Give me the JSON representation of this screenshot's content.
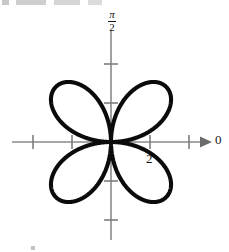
{
  "figure": {
    "caption_fragment": ""
  },
  "labels": {
    "theta_zero": "0",
    "radial_tick": "2",
    "pi_over_two_numerator": "π",
    "pi_over_two_denominator": "2"
  },
  "colors": {
    "curve": "#0b0b0b",
    "axis": "#8a8a8a",
    "tick": "#7e7e7e",
    "arrow": "#6b6b6b",
    "label_text": "#161616",
    "background": "#ffffff"
  },
  "chart_data": {
    "type": "line",
    "plot_kind": "polar-rose",
    "title": "",
    "subtitle": "",
    "xlabel": "",
    "ylabel": "",
    "equation": "r = 2 sin(2θ)",
    "petal_count": 4,
    "max_radius": 2,
    "petal_axis_angles_deg": [
      45,
      135,
      225,
      315
    ],
    "grid": false,
    "legend": null,
    "origin_px": {
      "x": 111,
      "y": 142
    },
    "pixels_per_unit": 39,
    "axes": [
      {
        "name": "polar-axis-horizontal",
        "direction": "theta = 0",
        "label": "0",
        "arrow": true,
        "start_px": {
          "x": 12,
          "y": 142
        },
        "end_px": {
          "x": 212,
          "y": 142
        },
        "tick_values": [
          -2,
          -1,
          1,
          2
        ],
        "tick_px_x": [
          33,
          72,
          150,
          189
        ],
        "labeled_ticks": [
          {
            "value": 2,
            "text": "2",
            "px_x": 150
          }
        ]
      },
      {
        "name": "polar-axis-vertical",
        "direction": "theta = pi/2",
        "label": "π/2",
        "arrow": false,
        "start_px": {
          "x": 111,
          "y": 30
        },
        "end_px": {
          "x": 111,
          "y": 240
        },
        "tick_values": [
          2,
          1,
          -1,
          -2
        ],
        "tick_px_y": [
          64,
          103,
          181,
          220
        ],
        "labeled_ticks": [
          {
            "value": 2,
            "text": "π/2",
            "px_y": 30
          }
        ]
      }
    ],
    "series": [
      {
        "name": "r = 2 sin(2θ)",
        "theta_deg": [
          0,
          10,
          20,
          30,
          40,
          45,
          50,
          60,
          70,
          80,
          90,
          100,
          110,
          120,
          130,
          135,
          140,
          150,
          160,
          170,
          180,
          190,
          200,
          210,
          220,
          225,
          230,
          240,
          250,
          260,
          270,
          280,
          290,
          300,
          310,
          315,
          320,
          330,
          340,
          350,
          360
        ],
        "r": [
          0.0,
          0.68,
          1.29,
          1.73,
          1.97,
          2.0,
          1.97,
          1.73,
          1.29,
          0.68,
          0.0,
          -0.68,
          -1.29,
          -1.73,
          -1.97,
          -2.0,
          -1.97,
          -1.73,
          -1.29,
          -0.68,
          0.0,
          0.68,
          1.29,
          1.73,
          1.97,
          2.0,
          1.97,
          1.73,
          1.29,
          0.68,
          0.0,
          -0.68,
          -1.29,
          -1.73,
          -1.97,
          -2.0,
          -1.97,
          -1.73,
          -1.29,
          -0.68,
          0.0
        ]
      }
    ],
    "petal_tips": [
      {
        "angle_deg": 45,
        "r": 2,
        "px": {
          "x": 139,
          "y": 114
        }
      },
      {
        "angle_deg": 135,
        "r": 2,
        "px": {
          "x": 83,
          "y": 114
        }
      },
      {
        "angle_deg": 225,
        "r": 2,
        "px": {
          "x": 83,
          "y": 170
        }
      },
      {
        "angle_deg": 315,
        "r": 2,
        "px": {
          "x": 139,
          "y": 170
        }
      }
    ]
  }
}
